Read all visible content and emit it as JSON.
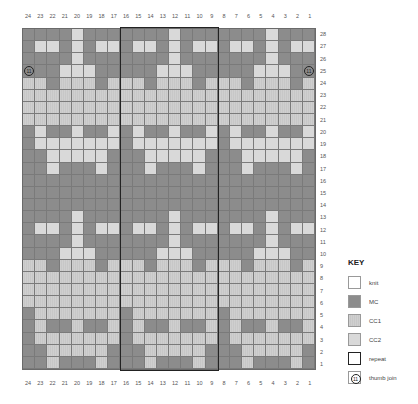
{
  "chart_data": {
    "type": "heatmap",
    "columns": [
      24,
      23,
      22,
      21,
      20,
      19,
      18,
      17,
      16,
      15,
      14,
      13,
      12,
      11,
      10,
      9,
      8,
      7,
      6,
      5,
      4,
      3,
      2,
      1
    ],
    "rows_top_to_bottom": [
      28,
      27,
      26,
      25,
      24,
      23,
      22,
      21,
      20,
      19,
      18,
      17,
      16,
      15,
      14,
      13,
      12,
      11,
      10,
      9,
      8,
      7,
      6,
      5,
      4,
      3,
      2,
      1
    ],
    "motif_width": 8,
    "motif_rows": {
      "28": "DDDDLDDD",
      "27": "DLLDLDLL",
      "26": "DDDDLDDD",
      "25": "DDDLLLDD",
      "24": "LLDLLLDL",
      "23": "LLLLLLLL",
      "22": "LLLLLLLL",
      "21": "LLLLLLLL",
      "20": "DLDDLDDL",
      "19": "DLLLLLLL",
      "18": "DDLLLLLD",
      "17": "DDLDDDLD",
      "16": "DDDDDDDD",
      "15": "DDDDDDDD",
      "14": "DDDDDDDD",
      "13": "DDDDLDDD",
      "12": "DLLDLDLL",
      "11": "DDDDLDDD",
      "10": "DDDLLLDD",
      "9": "LLDLLLDL",
      "8": "LLLLLLLL",
      "7": "LLLLLLLL",
      "6": "LLLLLLLL",
      "5": "DLLLLLLL",
      "4": "DLDDLDDL",
      "3": "DLLLLLLL",
      "2": "DDLLLLLD",
      "1": "DDLDDDLD"
    },
    "light_color_by_row": {
      "28": "CC2",
      "27": "CC2",
      "26": "CC2",
      "25": "CC2",
      "24": "CC1",
      "23": "CC1",
      "22": "CC1",
      "21": "CC1",
      "20": "CC2",
      "19": "CC2",
      "18": "CC2",
      "17": "CC2",
      "16": "CC2",
      "15": "CC2",
      "14": "CC2",
      "13": "CC2",
      "12": "CC2",
      "11": "CC2",
      "10": "CC2",
      "9": "CC1",
      "8": "CC1",
      "7": "CC1",
      "6": "CC1",
      "5": "CC1",
      "4": "CC1",
      "3": "CC1",
      "2": "CC1",
      "1": "CC1"
    },
    "repeat": {
      "from_col": 16,
      "to_col": 9,
      "rows": "1-28"
    },
    "thumb_join": [
      {
        "col": 24,
        "row": 25
      },
      {
        "col": 1,
        "row": 25
      }
    ]
  },
  "key": {
    "title": "KEY",
    "items": [
      {
        "id": "knit",
        "label": "knit"
      },
      {
        "id": "MC",
        "label": "MC"
      },
      {
        "id": "CC1",
        "label": "CC1"
      },
      {
        "id": "CC2",
        "label": "CC2"
      },
      {
        "id": "repeat",
        "label": "repeat"
      },
      {
        "id": "thumb",
        "label": "thumb join"
      }
    ]
  },
  "thumb_symbol": "⓫"
}
